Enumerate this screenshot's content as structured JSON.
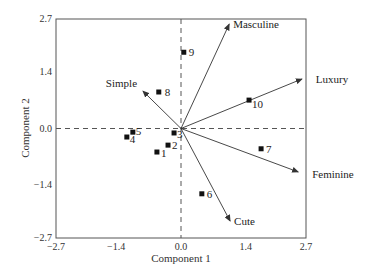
{
  "chart_data": {
    "type": "scatter",
    "subtype": "biplot",
    "title": "",
    "xlabel": "Component 1",
    "ylabel": "Component 2",
    "xlim": [
      -2.7,
      2.7
    ],
    "ylim": [
      -2.7,
      2.7
    ],
    "xticks": [
      "-2.7",
      "-1.4",
      "0.0",
      "1.4",
      "2.7"
    ],
    "yticks": [
      "-2.7",
      "-1.4",
      "0.0",
      "1.4",
      "2.7"
    ],
    "grid": false,
    "reference_lines": {
      "x0_dashed": true,
      "y0_dashed": true
    },
    "points": [
      {
        "label": "1",
        "x": -0.52,
        "y": -0.58
      },
      {
        "label": "2",
        "x": -0.28,
        "y": -0.41
      },
      {
        "label": "3",
        "x": -0.15,
        "y": -0.11
      },
      {
        "label": "4",
        "x": -1.17,
        "y": -0.21
      },
      {
        "label": "5",
        "x": -1.04,
        "y": -0.09
      },
      {
        "label": "6",
        "x": 0.45,
        "y": -1.61
      },
      {
        "label": "7",
        "x": 1.73,
        "y": -0.5
      },
      {
        "label": "8",
        "x": -0.48,
        "y": 0.9
      },
      {
        "label": "9",
        "x": 0.06,
        "y": 1.88
      },
      {
        "label": "10",
        "x": 1.47,
        "y": 0.7
      }
    ],
    "vectors": [
      {
        "label": "Masculine",
        "x": 1.04,
        "y": 2.57
      },
      {
        "label": "Luxury",
        "x": 2.61,
        "y": 1.22
      },
      {
        "label": "Feminine",
        "x": 2.53,
        "y": -1.07
      },
      {
        "label": "Cute",
        "x": 1.06,
        "y": -2.28
      },
      {
        "label": "Simple",
        "x": -0.82,
        "y": 0.92
      }
    ]
  }
}
